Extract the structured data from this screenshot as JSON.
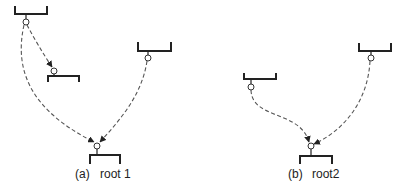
{
  "diagram": {
    "panels": [
      {
        "id": "a",
        "caption": "(a)",
        "root_label": "root 1",
        "nodes": [
          {
            "id": "a-top",
            "bracket": [
              15,
              6,
              47,
              14
            ],
            "node": [
              26,
              22
            ]
          },
          {
            "id": "a-mid",
            "bracket": [
              48,
              72,
              79,
              82
            ],
            "node": [
              54,
              71
            ]
          },
          {
            "id": "a-right",
            "bracket": [
              138,
              42,
              171,
              51
            ],
            "node": [
              148,
              58
            ]
          },
          {
            "id": "a-root",
            "bracket": [
              90,
              153,
              120,
              158
            ],
            "node": [
              97,
              146
            ]
          }
        ],
        "edges": [
          {
            "from": "a-top",
            "to": "a-mid"
          },
          {
            "from": "a-top",
            "to": "a-root"
          },
          {
            "from": "a-right",
            "to": "a-root"
          }
        ]
      },
      {
        "id": "b",
        "caption": "(b)",
        "root_label": "root2",
        "nodes": [
          {
            "id": "b-left",
            "bracket": [
              244,
              73,
              276,
              79
            ],
            "node": [
              251,
              87
            ]
          },
          {
            "id": "b-right",
            "bracket": [
              359,
              43,
              391,
              51
            ],
            "node": [
              371,
              58
            ]
          },
          {
            "id": "b-root",
            "bracket": [
              300,
              154,
              332,
              159
            ],
            "node": [
              311,
              146
            ]
          }
        ],
        "edges": [
          {
            "from": "b-left",
            "to": "b-root"
          },
          {
            "from": "b-right",
            "to": "b-root"
          }
        ]
      }
    ]
  }
}
